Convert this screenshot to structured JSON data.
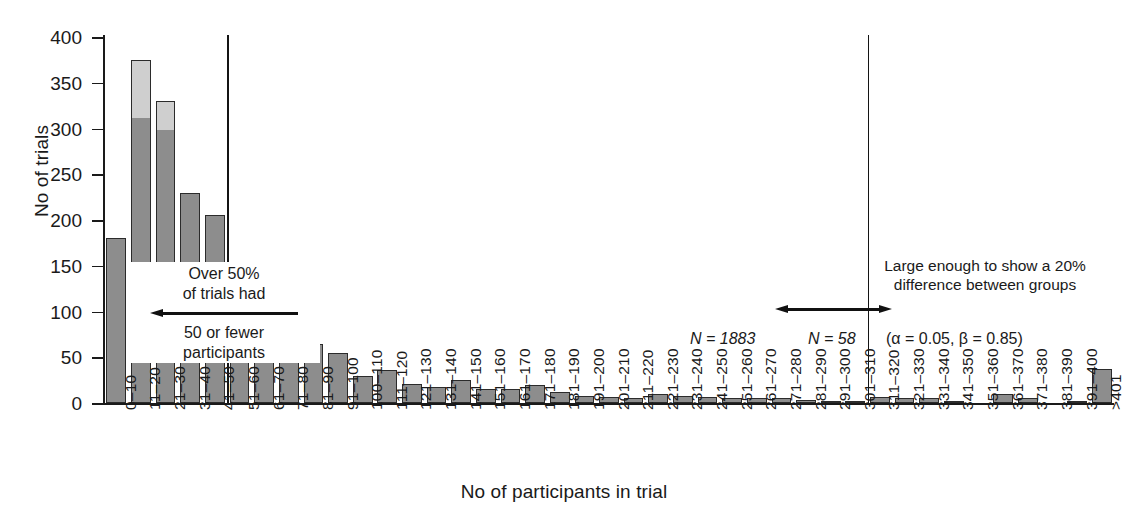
{
  "chart_data": {
    "type": "bar",
    "title": "",
    "xlabel": "No of participants in trial",
    "ylabel": "No of trials",
    "ylim": [
      0,
      400
    ],
    "yticks": [
      0,
      50,
      100,
      150,
      200,
      250,
      300,
      350,
      400
    ],
    "grid": false,
    "legend": "none",
    "categories": [
      "0–10",
      "11–20",
      "21–30",
      "31–40",
      "41–50",
      "51–60",
      "61–70",
      "71–80",
      "81–90",
      "91–100",
      "100–110",
      "111–120",
      "121–130",
      "131–140",
      "141–150",
      "151–160",
      "161–170",
      "171–180",
      "181–190",
      "191–200",
      "201–210",
      "211–220",
      "221–230",
      "231–240",
      "241–250",
      "251–260",
      "261–270",
      "271–280",
      "281–290",
      "291–300",
      "301–310",
      "311–320",
      "321–330",
      "331–340",
      "341–350",
      "351–360",
      "361–370",
      "371–380",
      "381–390",
      "391–400",
      ">401"
    ],
    "values": [
      180,
      375,
      330,
      229,
      206,
      142,
      66,
      73,
      65,
      55,
      29,
      36,
      21,
      17,
      25,
      15,
      15,
      20,
      12,
      8,
      7,
      6,
      10,
      8,
      7,
      6,
      6,
      5,
      3,
      2,
      2,
      7,
      6,
      5,
      2,
      0,
      10,
      5,
      0,
      1,
      37
    ],
    "cap_values": [
      0,
      313,
      300,
      0,
      0,
      0,
      0,
      0,
      0,
      0,
      0,
      0,
      0,
      0,
      0,
      0,
      0,
      0,
      0,
      0,
      0,
      0,
      0,
      0,
      0,
      0,
      0,
      0,
      0,
      0,
      0,
      0,
      0,
      0,
      0,
      0,
      0,
      0,
      0,
      0,
      0
    ],
    "reference_lines": [
      {
        "name": "fifty-participants-line",
        "after_category_index": 4
      },
      {
        "name": "power-threshold-line",
        "after_category_index": 30
      }
    ],
    "colors": {
      "bar_fill": "#8d8d8d",
      "bar_cap_fill": "#cfcfcf",
      "bar_edge": "#2b2b2b",
      "axis": "#1a1a1a",
      "text": "#1a1a1a"
    }
  },
  "annotations": {
    "left_callout": {
      "line1": "Over 50%",
      "line2": "of trials had",
      "line3": "50 or fewer",
      "line4": "participants",
      "arrow_direction": "left"
    },
    "right_callout": {
      "line1": "Large enough to show a 20%",
      "line2": "difference between groups",
      "arrow_direction": "right"
    },
    "counts": {
      "left_n": "N = 1883",
      "right_n": "N = 58",
      "power_note": "(α = 0.05, β = 0.85)"
    }
  }
}
